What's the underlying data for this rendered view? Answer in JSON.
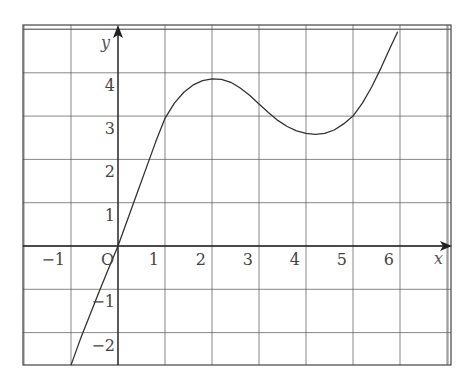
{
  "chart_data": {
    "type": "line",
    "title": "",
    "xlabel": "x",
    "ylabel": "y",
    "origin_label": "O",
    "xlim": [
      -2,
      7
    ],
    "ylim": [
      -2.75,
      4.95
    ],
    "grid": true,
    "x_ticks": [
      -1,
      1,
      2,
      3,
      4,
      5,
      6
    ],
    "x_tick_labels": [
      "−1",
      "1",
      "2",
      "3",
      "4",
      "5",
      "6"
    ],
    "y_ticks": [
      4,
      3,
      2,
      1,
      -1,
      -2
    ],
    "y_tick_labels": [
      "4",
      "3",
      "2",
      "1",
      "−1",
      "−2"
    ],
    "series": [
      {
        "name": "curve",
        "x": [
          -1.0,
          -0.8,
          -0.6,
          -0.4,
          -0.2,
          0.0,
          0.2,
          0.4,
          0.6,
          0.8,
          1.0,
          1.2,
          1.4,
          1.6,
          1.8,
          2.0,
          2.2,
          2.4,
          2.6,
          2.8,
          3.0,
          3.2,
          3.4,
          3.6,
          3.8,
          4.0,
          4.2,
          4.4,
          4.6,
          4.8,
          5.0,
          5.2,
          5.4,
          5.6,
          5.8,
          5.95
        ],
        "y": [
          -2.75,
          -2.15,
          -1.6,
          -1.05,
          -0.52,
          0.0,
          0.6,
          1.2,
          1.8,
          2.4,
          2.95,
          3.3,
          3.55,
          3.72,
          3.82,
          3.86,
          3.85,
          3.78,
          3.65,
          3.48,
          3.28,
          3.08,
          2.9,
          2.76,
          2.66,
          2.6,
          2.58,
          2.6,
          2.68,
          2.82,
          3.0,
          3.3,
          3.68,
          4.12,
          4.6,
          4.95
        ]
      }
    ]
  },
  "axes": {
    "x_label": "x",
    "y_label": "y",
    "origin": "O"
  },
  "colors": {
    "grid": "#555555",
    "axis": "#222222",
    "curve": "#333333"
  }
}
